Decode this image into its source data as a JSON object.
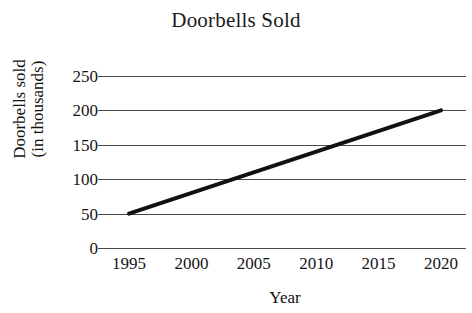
{
  "chart_data": {
    "type": "line",
    "title": "Doorbells Sold",
    "xlabel": "Year",
    "ylabel_line1": "Doorbells sold",
    "ylabel_line2": "(in thousands)",
    "ylabel": "Doorbells sold (in thousands)",
    "x": [
      1995,
      2020
    ],
    "x_tick_labels": [
      "1995",
      "2000",
      "2005",
      "2010",
      "2015",
      "2020"
    ],
    "x_ticks": [
      1995,
      2000,
      2005,
      2010,
      2015,
      2020
    ],
    "xlim": [
      1993,
      2022
    ],
    "y_tick_labels": [
      "250",
      "200",
      "150",
      "100",
      "50",
      "0"
    ],
    "y_ticks": [
      250,
      200,
      150,
      100,
      50,
      0
    ],
    "ylim": [
      0,
      250
    ],
    "grid": "horizontal",
    "legend": "none",
    "series": [
      {
        "name": "Doorbells sold",
        "x": [
          1995,
          2020
        ],
        "values": [
          50,
          200
        ],
        "color": "#111111",
        "line_width": 4
      }
    ],
    "annotations": []
  },
  "style": {
    "background": "#ffffff",
    "grid_color": "#4a4a4a",
    "text_color": "#151515",
    "line_color": "#111111"
  }
}
